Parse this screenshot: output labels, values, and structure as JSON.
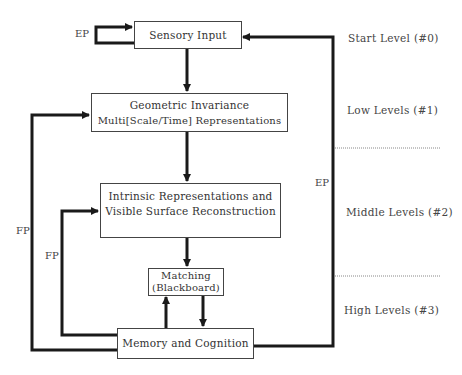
{
  "diagram": {
    "nodes": {
      "sensory_input": "Sensory Input",
      "geometric_line1": "Geometric Invariance",
      "geometric_line2": "Multi[Scale/Time] Representations",
      "intrinsic_line1": "Intrinsic Representations and",
      "intrinsic_line2": "Visible Surface Reconstruction",
      "matching_line1": "Matching",
      "matching_line2": "(Blackboard)",
      "memory": "Memory and Cognition"
    },
    "edge_labels": {
      "ep_self_loop": "EP",
      "ep_right": "EP",
      "fp_outer": "FP",
      "fp_inner": "FP"
    },
    "levels": [
      "Start Level (#0)",
      "Low Levels (#1)",
      "Middle Levels (#2)",
      "High Levels (#3)"
    ],
    "colors": {
      "line": "#1a1a1a",
      "box_border": "#444444",
      "divider": "#888888"
    }
  }
}
